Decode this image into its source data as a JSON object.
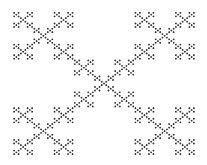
{
  "figure": {
    "type": "vicsek-x-fractal",
    "background": "#ffffff",
    "stroke_color": "#333333",
    "depth": 4,
    "bounds": {
      "x": 13,
      "y": 12,
      "width": 182,
      "height": 143
    }
  }
}
